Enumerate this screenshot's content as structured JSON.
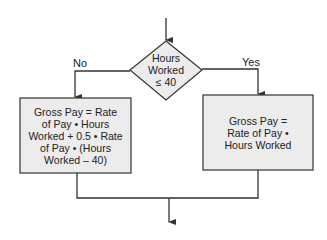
{
  "decision": {
    "text_lines": [
      "Hours",
      "Worked",
      "≤ 40"
    ]
  },
  "branches": {
    "no_label": "No",
    "yes_label": "Yes"
  },
  "process_no": {
    "text_lines": [
      "Gross Pay = Rate",
      "of Pay • Hours",
      "Worked + 0.5 • Rate",
      "of Pay • (Hours",
      "Worked – 40)"
    ]
  },
  "process_yes": {
    "text_lines": [
      "Gross Pay =",
      "Rate of Pay •",
      "Hours Worked"
    ]
  },
  "colors": {
    "box_fill": "#ececec",
    "stroke": "#333333"
  }
}
